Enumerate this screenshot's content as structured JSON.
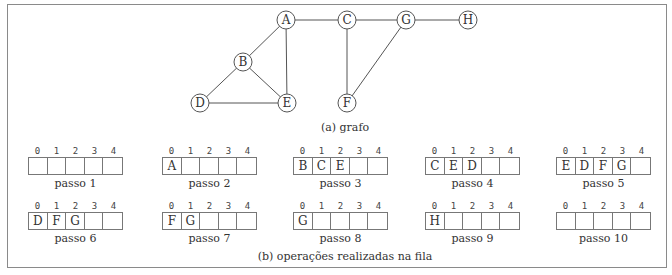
{
  "graph": {
    "caption": "(a) grafo",
    "nodes": [
      {
        "id": "A",
        "x": 286,
        "y": 20
      },
      {
        "id": "C",
        "x": 347,
        "y": 20
      },
      {
        "id": "G",
        "x": 406,
        "y": 20
      },
      {
        "id": "H",
        "x": 468,
        "y": 20
      },
      {
        "id": "B",
        "x": 243,
        "y": 62
      },
      {
        "id": "D",
        "x": 200,
        "y": 103
      },
      {
        "id": "E",
        "x": 287,
        "y": 103
      },
      {
        "id": "F",
        "x": 347,
        "y": 103
      }
    ],
    "edges": [
      [
        "A",
        "C"
      ],
      [
        "C",
        "G"
      ],
      [
        "G",
        "H"
      ],
      [
        "A",
        "B"
      ],
      [
        "A",
        "E"
      ],
      [
        "B",
        "D"
      ],
      [
        "B",
        "E"
      ],
      [
        "D",
        "E"
      ],
      [
        "C",
        "F"
      ],
      [
        "G",
        "F"
      ]
    ]
  },
  "queue": {
    "caption": "(b) operações realizadas na fila",
    "indices": [
      "0",
      "1",
      "2",
      "3",
      "4"
    ],
    "steps": [
      {
        "label": "passo 1",
        "cells": [
          "",
          "",
          "",
          "",
          ""
        ]
      },
      {
        "label": "passo 2",
        "cells": [
          "A",
          "",
          "",
          "",
          ""
        ]
      },
      {
        "label": "passo 3",
        "cells": [
          "B",
          "C",
          "E",
          "",
          ""
        ]
      },
      {
        "label": "passo 4",
        "cells": [
          "C",
          "E",
          "D",
          "",
          ""
        ]
      },
      {
        "label": "passo 5",
        "cells": [
          "E",
          "D",
          "F",
          "G",
          ""
        ]
      },
      {
        "label": "passo 6",
        "cells": [
          "D",
          "F",
          "G",
          "",
          ""
        ]
      },
      {
        "label": "passo 7",
        "cells": [
          "F",
          "G",
          "",
          "",
          ""
        ]
      },
      {
        "label": "passo 8",
        "cells": [
          "G",
          "",
          "",
          "",
          ""
        ]
      },
      {
        "label": "passo 9",
        "cells": [
          "H",
          "",
          "",
          "",
          ""
        ]
      },
      {
        "label": "passo 10",
        "cells": [
          "",
          "",
          "",
          "",
          ""
        ]
      }
    ]
  }
}
